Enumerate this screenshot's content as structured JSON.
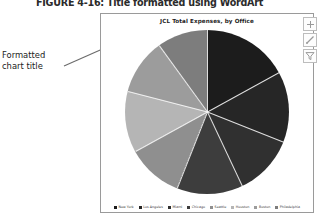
{
  "figure": {
    "number": "FIGURE 4-16:",
    "caption": "Title formatted using WordArt"
  },
  "annotation": {
    "text": "Formatted chart title"
  },
  "chart_buttons": [
    {
      "name": "chart-elements-button",
      "icon": "plus-icon",
      "label": "+"
    },
    {
      "name": "chart-styles-button",
      "icon": "brush-icon",
      "label": "Chart Styles"
    },
    {
      "name": "chart-filters-button",
      "icon": "funnel-icon",
      "label": "Chart Filters"
    }
  ],
  "chart_data": {
    "type": "pie",
    "title": "JCL Total Expenses, by Office",
    "xlabel": "",
    "ylabel": "",
    "legend_position": "bottom",
    "grid": false,
    "categories": [
      "New York",
      "Los Angeles",
      "Miami",
      "Chicago",
      "Seattle",
      "Houston",
      "Boston",
      "Philadelphia"
    ],
    "values": [
      17,
      14,
      12,
      13,
      11,
      12,
      11,
      10
    ],
    "colors": [
      "#1c1c1c",
      "#262626",
      "#303030",
      "#3d3d3d",
      "#8f8f8f",
      "#b5b5b5",
      "#9c9c9c",
      "#7d7d7d"
    ]
  }
}
